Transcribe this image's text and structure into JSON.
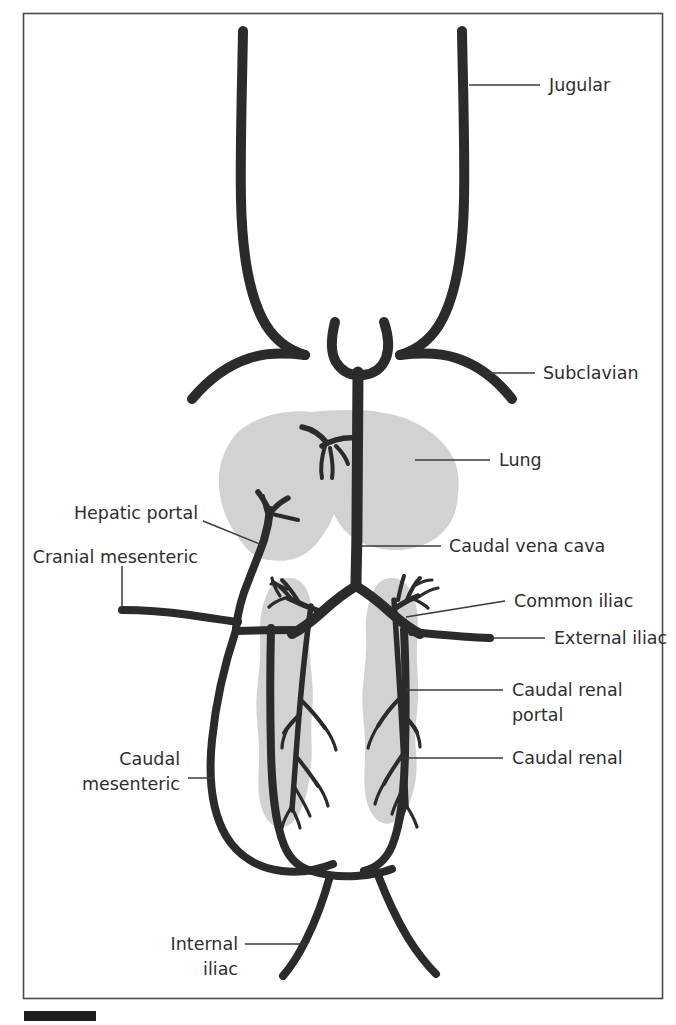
{
  "figure": {
    "type": "anatomical-diagram",
    "frame_color": "#4a4a4a",
    "vessel_color": "#2b2b2b",
    "organ_color": "#d2d2d2",
    "label_color": "#2e2e2e",
    "background": "#ffffff"
  },
  "labels": {
    "jugular": "Jugular",
    "subclavian": "Subclavian",
    "lung": "Lung",
    "hepatic_portal": "Hepatic portal",
    "cranial_mesenteric": "Cranial mesenteric",
    "caudal_vena_cava": "Caudal vena cava",
    "common_iliac": "Common iliac",
    "external_iliac": "External iliac",
    "caudal_renal_portal_line1": "Caudal renal",
    "caudal_renal_portal_line2": "portal",
    "caudal_renal": "Caudal renal",
    "caudal_mesenteric_line1": "Caudal",
    "caudal_mesenteric_line2": "mesenteric",
    "internal_iliac_line1": "Internal",
    "internal_iliac_line2": "iliac"
  },
  "organs": {
    "lung": "Lung",
    "kidney_left": "Kidney",
    "kidney_right": "Kidney",
    "heart": "Heart"
  },
  "vessels": [
    "Jugular",
    "Subclavian",
    "Caudal vena cava",
    "Hepatic portal",
    "Cranial mesenteric",
    "Caudal mesenteric",
    "Common iliac",
    "External iliac",
    "Internal iliac",
    "Caudal renal portal",
    "Caudal renal"
  ]
}
